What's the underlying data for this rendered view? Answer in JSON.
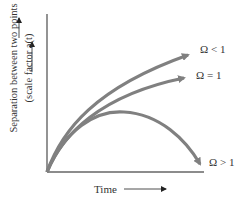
{
  "diagram": {
    "title": "",
    "y_axis": {
      "label_line1": "Separation between two points",
      "label_line2": "(scale factor a(t)",
      "arrow": "up"
    },
    "x_axis": {
      "label": "Time",
      "arrow": "right"
    },
    "curves": [
      {
        "id": "open",
        "label": "Ω < 1",
        "behavior": "expands forever, accelerating outward"
      },
      {
        "id": "flat",
        "label": "Ω = 1",
        "behavior": "expands forever, slowing"
      },
      {
        "id": "closed",
        "label": "Ω > 1",
        "behavior": "expands then recollapses"
      }
    ],
    "colors": {
      "curve": "#808080",
      "axis": "#555555",
      "text": "#333333"
    }
  }
}
